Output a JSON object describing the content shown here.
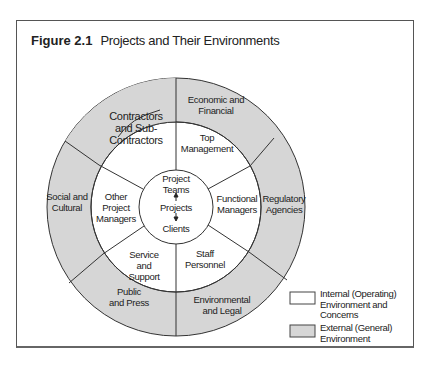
{
  "figure": {
    "number": "Figure 2.1",
    "title": "Projects and Their Environments"
  },
  "colors": {
    "external_fill": "#d6d6d6",
    "internal_fill": "#ffffff",
    "stroke": "#333333"
  },
  "center": {
    "top": "Project\nTeams",
    "middle": "Projects",
    "bottom": "Clients"
  },
  "internal_segments": [
    {
      "label": "Top\nManagement"
    },
    {
      "label": "Functional\nManagers"
    },
    {
      "label": "Staff\nPersonnel"
    },
    {
      "label": "Service\nand\nSupport"
    },
    {
      "label": "Other\nProject\nManagers"
    },
    {
      "label": "Contractors\nand Sub-\nContractors"
    }
  ],
  "external_segments": [
    {
      "label": "Economic and\nFinancial"
    },
    {
      "label": "Regulatory\nAgencies"
    },
    {
      "label": "Environmental\nand Legal"
    },
    {
      "label": "Public\nand Press"
    },
    {
      "label": "Social and\nCultural"
    }
  ],
  "legend": [
    {
      "label": "Internal (Operating)\nEnvironment and\nConcerns",
      "fill": "#ffffff"
    },
    {
      "label": "External (General)\nEnvironment",
      "fill": "#d6d6d6"
    }
  ]
}
